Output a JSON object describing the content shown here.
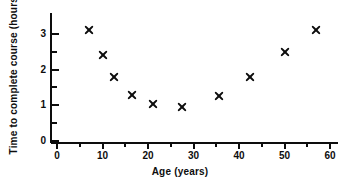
{
  "chart_data": {
    "type": "scatter",
    "title": "",
    "xlabel": "Age (years)",
    "ylabel": "Time to complete course (hours)",
    "xlim": [
      0,
      63
    ],
    "ylim": [
      0,
      3.5
    ],
    "grid": false,
    "legend": null,
    "marker_style": "x-cross",
    "marker_color": "#0d0d0d",
    "xticks": [
      0,
      10,
      20,
      30,
      40,
      50,
      60
    ],
    "xtick_labels": [
      "0",
      "10",
      "20",
      "30",
      "40",
      "50",
      "60"
    ],
    "x_minor_ticks": [
      5,
      15,
      25,
      35,
      45,
      55
    ],
    "yticks": [
      0,
      1,
      2,
      3
    ],
    "ytick_labels": [
      "0",
      "1",
      "2",
      "3"
    ],
    "y_minor_ticks": [
      0.5,
      1.5,
      2.5
    ],
    "points": [
      {
        "x": 7,
        "y": 3.1
      },
      {
        "x": 10,
        "y": 2.4
      },
      {
        "x": 12.5,
        "y": 1.8
      },
      {
        "x": 16.5,
        "y": 1.3
      },
      {
        "x": 21,
        "y": 1.05
      },
      {
        "x": 27.5,
        "y": 0.95
      },
      {
        "x": 35.5,
        "y": 1.25
      },
      {
        "x": 42.5,
        "y": 1.8
      },
      {
        "x": 50,
        "y": 2.5
      },
      {
        "x": 57,
        "y": 3.1
      }
    ]
  }
}
